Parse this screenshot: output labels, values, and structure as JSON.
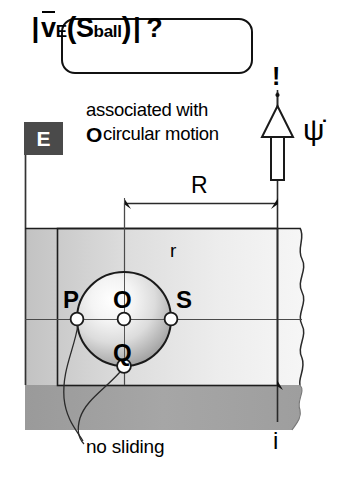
{
  "formula": {
    "full": "|v̄_E(S_ball)| ?",
    "abs_left": "|",
    "v_symbol": "v",
    "subscript_frame": "E",
    "open_paren": "(",
    "s_symbol": "S",
    "subscript_body": "ball",
    "close_paren": ")",
    "abs_right": "|",
    "question": "?"
  },
  "annotation": {
    "line1": "associated with",
    "bullet": "O",
    "line2": "circular motion",
    "exclamation": "!",
    "psi_dot": "ψ̇"
  },
  "frame_flag": {
    "label": "E",
    "flag_color": "#4a4a4a",
    "label_color": "#ffffff"
  },
  "dimensions": {
    "R_label": "R",
    "r_label": "r"
  },
  "points": {
    "P": "P",
    "O": "O",
    "S": "S",
    "Q": "Q"
  },
  "axis": {
    "i_label": "i"
  },
  "callout": {
    "no_sliding": "no sliding"
  },
  "colors": {
    "ink": "#111111",
    "surface_light": "#e2e2e2",
    "surface_mid": "#c9c9c9",
    "surface_dark": "#9b9b9b",
    "flag_gray": "#4a4a4a",
    "ball_highlight": "#fdfdfd",
    "ball_shadow": "#8a8a8a",
    "white": "#ffffff"
  },
  "geometry": {
    "ball_center_x": 124,
    "ball_center_y": 319,
    "ball_radius": 47,
    "axis_x": 277,
    "R_span_start_x": 125,
    "R_span_end_x": 277,
    "R_dim_y": 203,
    "ground_y": 385
  }
}
